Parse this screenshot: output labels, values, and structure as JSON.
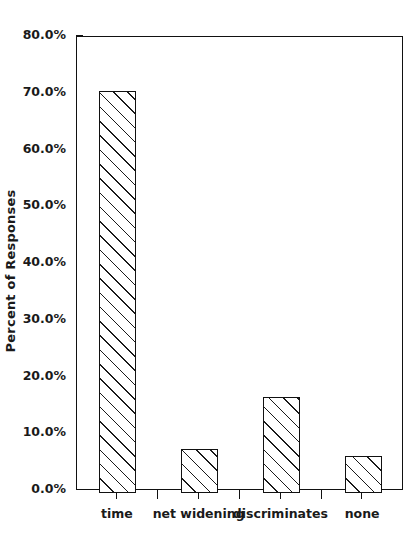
{
  "chart_data": {
    "type": "bar",
    "title": "",
    "subtitle": "",
    "xlabel": "",
    "ylabel": "Percent of Responses",
    "categories": [
      "time",
      "net widening",
      "discriminates",
      "none"
    ],
    "values": [
      70.5,
      7.4,
      16.6,
      6.1
    ],
    "value_labels": [
      "70.5%",
      "7.4%",
      "16.6%",
      "6.1%"
    ],
    "ylim": [
      0.0,
      80.0
    ],
    "ytick_values": [
      0.0,
      10.0,
      20.0,
      30.0,
      40.0,
      50.0,
      60.0,
      70.0,
      80.0
    ],
    "ytick_labels": [
      "0.0%",
      "10.0%",
      "20.0%",
      "30.0%",
      "40.0%",
      "50.0%",
      "60.0%",
      "70.0%",
      "80.0%"
    ],
    "grid": false,
    "legend": false,
    "legend_position": "none",
    "bar_fill": "diagonal-hatch",
    "bar_edge_color": "#111111",
    "bar_face_color": "#ffffff",
    "axis_color": "#111111",
    "background_color": "#ffffff",
    "text_color": "#1a1a1a"
  },
  "axis": {
    "y_title": "Percent of Responses"
  }
}
